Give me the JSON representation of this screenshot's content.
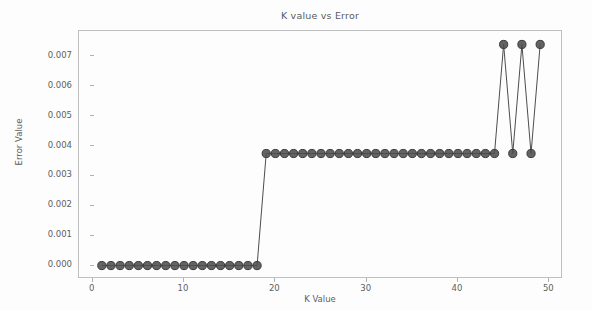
{
  "chart_data": {
    "type": "line",
    "title": "K value vs Error",
    "xlabel": "K Value",
    "ylabel": "Error Value",
    "xlim": [
      -1.5,
      51.5
    ],
    "ylim": [
      -0.00045,
      0.00785
    ],
    "grid": false,
    "legend": null,
    "marker": "circle",
    "marker_color": "#4d4d4d",
    "line_color": "#4d4d4d",
    "xticks": [
      0,
      10,
      20,
      30,
      40,
      50
    ],
    "xticklabels": [
      "0",
      "10",
      "20",
      "30",
      "40",
      "50"
    ],
    "yticks": [
      0.0,
      0.001,
      0.002,
      0.003,
      0.004,
      0.005,
      0.006,
      0.007
    ],
    "yticklabels": [
      "0.000",
      "0.001",
      "0.002",
      "0.003",
      "0.004",
      "0.005",
      "0.006",
      "0.007"
    ],
    "x": [
      1,
      2,
      3,
      4,
      5,
      6,
      7,
      8,
      9,
      10,
      11,
      12,
      13,
      14,
      15,
      16,
      17,
      18,
      19,
      20,
      21,
      22,
      23,
      24,
      25,
      26,
      27,
      28,
      29,
      30,
      31,
      32,
      33,
      34,
      35,
      36,
      37,
      38,
      39,
      40,
      41,
      42,
      43,
      44,
      45,
      46,
      47,
      48,
      49
    ],
    "y": [
      0.0,
      0.0,
      0.0,
      0.0,
      0.0,
      0.0,
      0.0,
      0.0,
      0.0,
      0.0,
      0.0,
      0.0,
      0.0,
      0.0,
      0.0,
      0.0,
      0.0,
      0.0,
      0.00375,
      0.00375,
      0.00375,
      0.00375,
      0.00375,
      0.00375,
      0.00375,
      0.00375,
      0.00375,
      0.00375,
      0.00375,
      0.00375,
      0.00375,
      0.00375,
      0.00375,
      0.00375,
      0.00375,
      0.00375,
      0.00375,
      0.00375,
      0.00375,
      0.00375,
      0.00375,
      0.00375,
      0.00375,
      0.00375,
      0.0074,
      0.00375,
      0.0074,
      0.00375,
      0.0074
    ]
  },
  "figure": {
    "background_color": "#fdfdfd",
    "frame_color": "#bfbfbf",
    "text_color": "#5d5d5d"
  }
}
